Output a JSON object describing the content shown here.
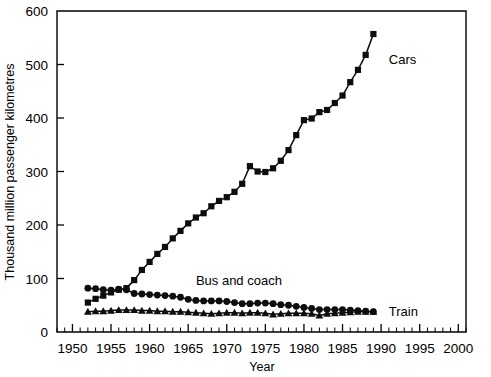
{
  "chart_data": {
    "type": "line",
    "title": "",
    "subtitle": "",
    "xlabel": "Year",
    "ylabel": "Thousand million passenger kilometres",
    "xlim": [
      1948,
      2001
    ],
    "ylim": [
      0,
      600
    ],
    "grid": false,
    "legend_position": "inline-annotations",
    "x_ticks": [
      1950,
      1955,
      1960,
      1965,
      1970,
      1975,
      1980,
      1985,
      1990,
      1995,
      2000
    ],
    "x_tick_labels": [
      "1950",
      "1955",
      "1960",
      "1965",
      "1970",
      "1975",
      "1980",
      "1985",
      "1990",
      "1995",
      "2000"
    ],
    "x_minor_tick_step": 1,
    "y_ticks": [
      0,
      100,
      200,
      300,
      400,
      500,
      600
    ],
    "y_tick_labels": [
      "0",
      "100",
      "200",
      "300",
      "400",
      "500",
      "600"
    ],
    "x": [
      1952,
      1953,
      1954,
      1955,
      1956,
      1957,
      1958,
      1959,
      1960,
      1961,
      1962,
      1963,
      1964,
      1965,
      1966,
      1967,
      1968,
      1969,
      1970,
      1971,
      1972,
      1973,
      1974,
      1975,
      1976,
      1977,
      1978,
      1979,
      1980,
      1981,
      1982,
      1983,
      1984,
      1985,
      1986,
      1987,
      1988,
      1989
    ],
    "series": [
      {
        "name": "Cars",
        "marker": "square",
        "label_text": "Cars",
        "values": [
          55,
          62,
          68,
          74,
          79,
          82,
          97,
          116,
          131,
          146,
          159,
          175,
          189,
          203,
          214,
          222,
          235,
          245,
          252,
          262,
          277,
          310,
          300,
          299,
          306,
          320,
          340,
          368,
          396,
          399,
          411,
          415,
          428,
          442,
          467,
          490,
          518,
          557
        ]
      },
      {
        "name": "Bus and coach",
        "marker": "circle",
        "label_text": "Bus and coach",
        "values": [
          82,
          81,
          79,
          78,
          80,
          79,
          72,
          71,
          70,
          69,
          68,
          67,
          65,
          61,
          59,
          58,
          58,
          58,
          57,
          55,
          53,
          53,
          54,
          54,
          53,
          51,
          50,
          48,
          46,
          44,
          42,
          42,
          42,
          42,
          41,
          40,
          39,
          38
        ]
      },
      {
        "name": "Train",
        "marker": "triangle",
        "label_text": "Train",
        "values": [
          38,
          39,
          39,
          40,
          41,
          41,
          41,
          40,
          40,
          39,
          39,
          38,
          38,
          37,
          36,
          35,
          34,
          35,
          36,
          36,
          35,
          36,
          36,
          35,
          33,
          34,
          35,
          35,
          35,
          34,
          31,
          34,
          35,
          36,
          37,
          38,
          38,
          38
        ]
      }
    ],
    "annotations": [
      {
        "text": "Cars",
        "x": 1991,
        "y": 510
      },
      {
        "text": "Bus and coach",
        "x": 1966,
        "y": 97
      },
      {
        "text": "Train",
        "x": 1991,
        "y": 40
      }
    ]
  },
  "colors": {
    "ink": "#0d0d0d",
    "background": "#ffffff"
  }
}
